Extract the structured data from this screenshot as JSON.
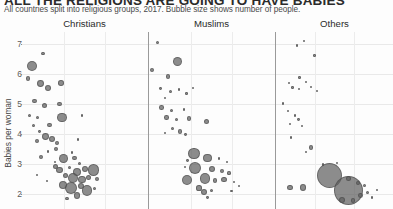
{
  "header": {
    "title": "ALL THE RELIGIONS ARE GOING TO HAVE BABIES",
    "subtitle": "All countries split into religious groups, 2017. Bubble size shows number of people."
  },
  "chart_data": {
    "type": "scatter",
    "title": "ALL THE RELIGIONS ARE GOING TO HAVE BABIES",
    "subtitle": "All countries split into religious groups, 2017. Bubble size shows number of people.",
    "ylabel": "Babies per woman",
    "xlabel": "",
    "ylim": [
      1.5,
      7.4
    ],
    "yticks": [
      7,
      6,
      5,
      4,
      3,
      2
    ],
    "grid": true,
    "legend": "none",
    "size_encoding": "Bubble size shows number of people",
    "panels": [
      {
        "name": "Christians",
        "x_index": 0,
        "points": [
          {
            "x": 0.08,
            "y": 6.28,
            "r": 5.0
          },
          {
            "x": 0.17,
            "y": 6.68,
            "r": 1.8
          },
          {
            "x": 0.05,
            "y": 5.85,
            "r": 2.2
          },
          {
            "x": 0.15,
            "y": 5.68,
            "r": 3.4
          },
          {
            "x": 0.21,
            "y": 5.52,
            "r": 3.0
          },
          {
            "x": 0.31,
            "y": 5.7,
            "r": 2.8
          },
          {
            "x": 0.1,
            "y": 5.1,
            "r": 2.2
          },
          {
            "x": 0.18,
            "y": 4.95,
            "r": 2.6
          },
          {
            "x": 0.3,
            "y": 5.0,
            "r": 2.3
          },
          {
            "x": 0.06,
            "y": 4.62,
            "r": 1.8
          },
          {
            "x": 0.12,
            "y": 4.56,
            "r": 1.5
          },
          {
            "x": 0.32,
            "y": 4.55,
            "r": 4.6
          },
          {
            "x": 0.48,
            "y": 4.62,
            "r": 1.2
          },
          {
            "x": 0.09,
            "y": 4.28,
            "r": 1.6
          },
          {
            "x": 0.22,
            "y": 4.3,
            "r": 2.4
          },
          {
            "x": 0.14,
            "y": 4.08,
            "r": 1.4
          },
          {
            "x": 0.19,
            "y": 3.92,
            "r": 3.4
          },
          {
            "x": 0.24,
            "y": 3.85,
            "r": 3.0
          },
          {
            "x": 0.12,
            "y": 3.78,
            "r": 2.0
          },
          {
            "x": 0.28,
            "y": 3.7,
            "r": 2.1
          },
          {
            "x": 0.45,
            "y": 3.82,
            "r": 1.2
          },
          {
            "x": 0.27,
            "y": 3.5,
            "r": 2.0
          },
          {
            "x": 0.21,
            "y": 3.42,
            "r": 1.2
          },
          {
            "x": 0.4,
            "y": 3.38,
            "r": 1.4
          },
          {
            "x": 0.15,
            "y": 3.22,
            "r": 2.0
          },
          {
            "x": 0.33,
            "y": 3.18,
            "r": 4.4
          },
          {
            "x": 0.42,
            "y": 3.2,
            "r": 2.4
          },
          {
            "x": 0.46,
            "y": 3.02,
            "r": 1.6
          },
          {
            "x": 0.27,
            "y": 2.92,
            "r": 2.8
          },
          {
            "x": 0.3,
            "y": 2.8,
            "r": 3.4
          },
          {
            "x": 0.38,
            "y": 2.88,
            "r": 1.6
          },
          {
            "x": 0.44,
            "y": 2.74,
            "r": 4.2
          },
          {
            "x": 0.5,
            "y": 2.82,
            "r": 3.0
          },
          {
            "x": 0.57,
            "y": 2.8,
            "r": 5.6
          },
          {
            "x": 0.35,
            "y": 2.62,
            "r": 2.6
          },
          {
            "x": 0.41,
            "y": 2.52,
            "r": 5.0
          },
          {
            "x": 0.48,
            "y": 2.48,
            "r": 3.6
          },
          {
            "x": 0.53,
            "y": 2.56,
            "r": 2.6
          },
          {
            "x": 0.6,
            "y": 2.5,
            "r": 2.0
          },
          {
            "x": 0.33,
            "y": 2.3,
            "r": 4.2
          },
          {
            "x": 0.39,
            "y": 2.2,
            "r": 6.2
          },
          {
            "x": 0.47,
            "y": 2.26,
            "r": 3.0
          },
          {
            "x": 0.52,
            "y": 2.12,
            "r": 5.2
          },
          {
            "x": 0.58,
            "y": 2.18,
            "r": 1.8
          },
          {
            "x": 0.44,
            "y": 1.95,
            "r": 3.2
          },
          {
            "x": 0.36,
            "y": 1.85,
            "r": 1.6
          },
          {
            "x": 0.12,
            "y": 2.62,
            "r": 1.0
          },
          {
            "x": 0.2,
            "y": 2.42,
            "r": 1.0
          },
          {
            "x": 0.26,
            "y": 3.08,
            "r": 0.9
          }
        ]
      },
      {
        "name": "Muslims",
        "x_index": 1,
        "points": [
          {
            "x": 0.07,
            "y": 7.05,
            "r": 1.6
          },
          {
            "x": 0.23,
            "y": 6.42,
            "r": 4.8
          },
          {
            "x": 0.02,
            "y": 6.12,
            "r": 2.0
          },
          {
            "x": 0.15,
            "y": 5.92,
            "r": 2.2
          },
          {
            "x": 0.09,
            "y": 5.52,
            "r": 1.4
          },
          {
            "x": 0.17,
            "y": 5.42,
            "r": 1.6
          },
          {
            "x": 0.24,
            "y": 5.48,
            "r": 1.2
          },
          {
            "x": 0.3,
            "y": 5.35,
            "r": 1.3
          },
          {
            "x": 0.13,
            "y": 5.2,
            "r": 1.2
          },
          {
            "x": 0.35,
            "y": 5.55,
            "r": 0.9
          },
          {
            "x": 0.1,
            "y": 4.88,
            "r": 2.2
          },
          {
            "x": 0.18,
            "y": 4.78,
            "r": 1.6
          },
          {
            "x": 0.28,
            "y": 4.82,
            "r": 1.4
          },
          {
            "x": 0.14,
            "y": 4.55,
            "r": 2.2
          },
          {
            "x": 0.22,
            "y": 4.48,
            "r": 1.8
          },
          {
            "x": 0.32,
            "y": 4.52,
            "r": 2.4
          },
          {
            "x": 0.46,
            "y": 4.42,
            "r": 2.8
          },
          {
            "x": 0.19,
            "y": 4.18,
            "r": 1.5
          },
          {
            "x": 0.25,
            "y": 4.08,
            "r": 2.2
          },
          {
            "x": 0.29,
            "y": 3.98,
            "r": 1.4
          },
          {
            "x": 0.13,
            "y": 4.02,
            "r": 1.0
          },
          {
            "x": 0.36,
            "y": 3.35,
            "r": 5.6
          },
          {
            "x": 0.47,
            "y": 3.2,
            "r": 4.4
          },
          {
            "x": 0.31,
            "y": 3.12,
            "r": 1.4
          },
          {
            "x": 0.56,
            "y": 3.18,
            "r": 1.2
          },
          {
            "x": 0.62,
            "y": 3.08,
            "r": 1.0
          },
          {
            "x": 0.37,
            "y": 2.86,
            "r": 6.2
          },
          {
            "x": 0.5,
            "y": 2.82,
            "r": 3.0
          },
          {
            "x": 0.58,
            "y": 2.78,
            "r": 2.0
          },
          {
            "x": 0.29,
            "y": 2.9,
            "r": 1.2
          },
          {
            "x": 0.64,
            "y": 2.7,
            "r": 1.6
          },
          {
            "x": 0.3,
            "y": 2.48,
            "r": 5.0
          },
          {
            "x": 0.45,
            "y": 2.52,
            "r": 5.2
          },
          {
            "x": 0.53,
            "y": 2.45,
            "r": 2.2
          },
          {
            "x": 0.6,
            "y": 2.48,
            "r": 2.6
          },
          {
            "x": 0.68,
            "y": 2.4,
            "r": 1.4
          },
          {
            "x": 0.4,
            "y": 2.2,
            "r": 2.6
          },
          {
            "x": 0.44,
            "y": 2.08,
            "r": 3.0
          },
          {
            "x": 0.5,
            "y": 2.12,
            "r": 1.6
          },
          {
            "x": 0.66,
            "y": 2.1,
            "r": 1.2
          },
          {
            "x": 0.47,
            "y": 1.88,
            "r": 1.4
          },
          {
            "x": 0.72,
            "y": 2.28,
            "r": 0.9
          }
        ]
      },
      {
        "name": "Others",
        "x_index": 2,
        "points": [
          {
            "x": 0.18,
            "y": 6.95,
            "r": 1.2
          },
          {
            "x": 0.24,
            "y": 7.1,
            "r": 0.9
          },
          {
            "x": 0.33,
            "y": 6.62,
            "r": 1.2
          },
          {
            "x": 0.2,
            "y": 5.88,
            "r": 1.2
          },
          {
            "x": 0.11,
            "y": 5.7,
            "r": 1.4
          },
          {
            "x": 0.26,
            "y": 5.72,
            "r": 1.0
          },
          {
            "x": 0.14,
            "y": 5.55,
            "r": 1.2
          },
          {
            "x": 0.2,
            "y": 5.5,
            "r": 1.0
          },
          {
            "x": 0.3,
            "y": 5.58,
            "r": 1.0
          },
          {
            "x": 0.35,
            "y": 5.45,
            "r": 0.9
          },
          {
            "x": 0.06,
            "y": 5.02,
            "r": 1.2
          },
          {
            "x": 0.1,
            "y": 4.78,
            "r": 0.9
          },
          {
            "x": 0.16,
            "y": 4.62,
            "r": 1.2
          },
          {
            "x": 0.19,
            "y": 4.48,
            "r": 1.4
          },
          {
            "x": 0.12,
            "y": 4.35,
            "r": 1.0
          },
          {
            "x": 0.22,
            "y": 4.28,
            "r": 0.9
          },
          {
            "x": 0.13,
            "y": 3.88,
            "r": 1.2
          },
          {
            "x": 0.3,
            "y": 3.55,
            "r": 2.2
          },
          {
            "x": 0.26,
            "y": 3.4,
            "r": 1.0
          },
          {
            "x": 0.4,
            "y": 2.98,
            "r": 1.2
          },
          {
            "x": 0.46,
            "y": 2.62,
            "r": 12.5
          },
          {
            "x": 0.62,
            "y": 2.12,
            "r": 14.5
          },
          {
            "x": 0.12,
            "y": 2.22,
            "r": 2.6
          },
          {
            "x": 0.23,
            "y": 2.22,
            "r": 3.2
          },
          {
            "x": 0.62,
            "y": 2.52,
            "r": 2.6
          },
          {
            "x": 0.7,
            "y": 2.38,
            "r": 2.0
          },
          {
            "x": 0.76,
            "y": 2.28,
            "r": 1.6
          },
          {
            "x": 0.72,
            "y": 1.95,
            "r": 2.4
          },
          {
            "x": 0.78,
            "y": 2.05,
            "r": 1.8
          },
          {
            "x": 0.82,
            "y": 1.88,
            "r": 1.4
          },
          {
            "x": 0.56,
            "y": 1.8,
            "r": 3.0
          },
          {
            "x": 0.66,
            "y": 1.78,
            "r": 2.2
          },
          {
            "x": 0.86,
            "y": 2.12,
            "r": 1.0
          },
          {
            "x": 0.52,
            "y": 3.02,
            "r": 1.0
          }
        ]
      }
    ]
  }
}
